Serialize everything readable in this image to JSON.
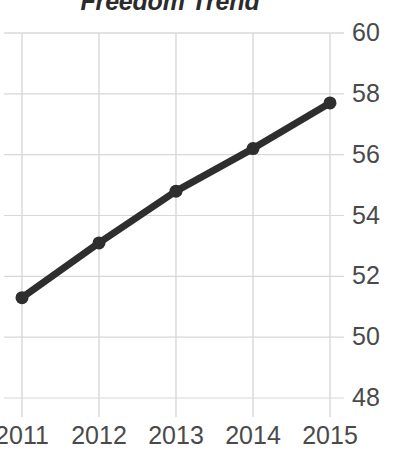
{
  "chart_data": {
    "type": "line",
    "title": "Freedom Trend",
    "xlabel": "",
    "ylabel": "",
    "categories": [
      "2011",
      "2012",
      "2013",
      "2014",
      "2015"
    ],
    "x": [
      2011,
      2012,
      2013,
      2014,
      2015
    ],
    "values": [
      51.3,
      53.1,
      54.8,
      56.2,
      57.7
    ],
    "series": [
      {
        "name": "Freedom Trend",
        "values": [
          51.3,
          53.1,
          54.8,
          56.2,
          57.7
        ]
      }
    ],
    "ylim": [
      48,
      60
    ],
    "xlim": [
      2011,
      2015
    ],
    "ytick_labels": [
      "60",
      "58",
      "56",
      "54",
      "52",
      "50",
      "48"
    ],
    "ytick_values": [
      60,
      58,
      56,
      54,
      52,
      50,
      48
    ],
    "xtick_labels": [
      "2011",
      "2012",
      "2013",
      "2014",
      "2015"
    ],
    "grid": true,
    "grid_axis": "both",
    "legend": false,
    "legend_position": "none",
    "y_axis_side": "right",
    "markers": true,
    "colors": {
      "line": "#2e2e2e",
      "marker": "#2e2e2e",
      "grid": "#d8d8d8",
      "tick_label": "#4a4a4a",
      "title": "#2b2b2b",
      "background": "#ffffff"
    }
  }
}
